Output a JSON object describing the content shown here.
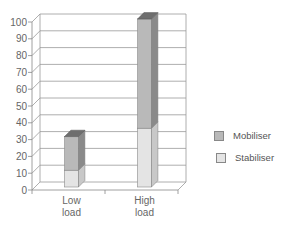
{
  "chart_data": {
    "type": "bar",
    "stacked": true,
    "three_d": true,
    "title": "",
    "xlabel": "",
    "ylabel": "",
    "categories": [
      "Low load",
      "High load"
    ],
    "category_lines": [
      [
        "Low",
        "load"
      ],
      [
        "High",
        "load"
      ]
    ],
    "series": [
      {
        "name": "Stabiliser",
        "values": [
          10,
          35
        ],
        "color": "#e4e4e4",
        "side_color": "#c8c8c8"
      },
      {
        "name": "Mobiliser",
        "values": [
          20,
          65
        ],
        "color": "#b9b9b9",
        "side_color": "#8a8a8a",
        "top_color": "#6e6e6e"
      }
    ],
    "ylim": [
      0,
      100
    ],
    "yticks": [
      0,
      10,
      20,
      30,
      40,
      50,
      60,
      70,
      80,
      90,
      100
    ],
    "grid": true,
    "legend_position": "right"
  },
  "legend": {
    "items": [
      {
        "label": "Mobiliser",
        "color": "#b9b9b9"
      },
      {
        "label": "Stabiliser",
        "color": "#e4e4e4"
      }
    ]
  }
}
